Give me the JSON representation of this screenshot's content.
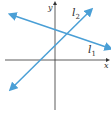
{
  "diagram": {
    "title": "",
    "axes": {
      "x_label": "x",
      "y_label": "y"
    },
    "lines": [
      {
        "name": "l1",
        "label": "l",
        "subscript": "1",
        "color": "#4a9fd6",
        "arrows": "both",
        "slope": "negative"
      },
      {
        "name": "l2",
        "label": "l",
        "subscript": "2",
        "color": "#4a9fd6",
        "arrows": "both",
        "slope": "positive"
      }
    ],
    "axis_color": "#333333"
  }
}
